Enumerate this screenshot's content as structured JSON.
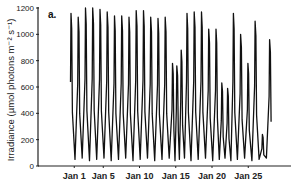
{
  "chart_data": {
    "type": "line",
    "title": "",
    "panel_label": "a.",
    "xlabel": "",
    "ylabel": "Irradiance (µmol photons m⁻² s⁻¹)",
    "ylim": [
      0,
      1200
    ],
    "yticks": [
      0,
      200,
      400,
      600,
      800,
      1000,
      1200
    ],
    "xtick_labels": [
      "Jan 1",
      "Jan 5",
      "Jan 10",
      "Jan 15",
      "Jan 20",
      "Jan 25"
    ],
    "xtick_days": [
      1,
      5,
      10,
      15,
      20,
      25
    ],
    "grid": false,
    "legend": null,
    "series": [
      {
        "name": "Irradiance",
        "color": "#111111",
        "daily_peaks": [
          {
            "day": 0.6,
            "peak": 1160
          },
          {
            "day": 1.6,
            "peak": 1130
          },
          {
            "day": 2.6,
            "peak": 1200
          },
          {
            "day": 3.6,
            "peak": 1200
          },
          {
            "day": 4.6,
            "peak": 1190
          },
          {
            "day": 5.6,
            "peak": 1170
          },
          {
            "day": 6.6,
            "peak": 1140
          },
          {
            "day": 7.6,
            "peak": 1140
          },
          {
            "day": 8.6,
            "peak": 1130
          },
          {
            "day": 9.6,
            "peak": 1180
          },
          {
            "day": 10.6,
            "peak": 1180
          },
          {
            "day": 11.6,
            "peak": 1130
          },
          {
            "day": 12.6,
            "peak": 1120
          },
          {
            "day": 13.6,
            "peak": 1130
          },
          {
            "day": 14.6,
            "peak": 780
          },
          {
            "day": 15.2,
            "peak": 760
          },
          {
            "day": 15.8,
            "peak": 880
          },
          {
            "day": 16.6,
            "peak": 1160
          },
          {
            "day": 17.6,
            "peak": 1170
          },
          {
            "day": 18.6,
            "peak": 1170
          },
          {
            "day": 19.6,
            "peak": 1040
          },
          {
            "day": 20.6,
            "peak": 1040
          },
          {
            "day": 21.4,
            "peak": 630
          },
          {
            "day": 22.2,
            "peak": 590
          },
          {
            "day": 23.0,
            "peak": 1160
          },
          {
            "day": 24.0,
            "peak": 1000
          },
          {
            "day": 25.0,
            "peak": 780
          },
          {
            "day": 26.0,
            "peak": 1100
          },
          {
            "day": 27.0,
            "peak": 240
          },
          {
            "day": 28.0,
            "peak": 960
          }
        ],
        "night_minimum": 40
      }
    ]
  },
  "layout": {
    "plot_left": 38,
    "plot_right": 291,
    "plot_top": 8,
    "plot_bottom": 166,
    "day0_x": 67,
    "px_per_day": 7.25
  }
}
